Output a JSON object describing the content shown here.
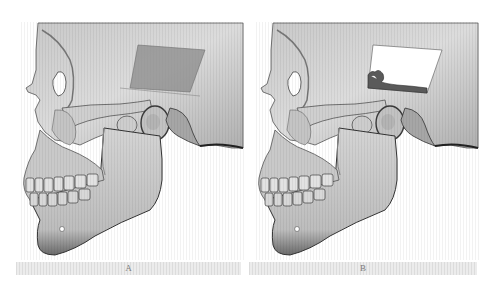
{
  "figure": {
    "panels": [
      {
        "id": "A",
        "label": "A",
        "subject": "lateral 3D skull rendering with semi-transparent rectangular plane over temporal region",
        "overlay": {
          "type": "plane",
          "color": "#8a8a8a",
          "opacity": 0.75
        }
      },
      {
        "id": "B",
        "label": "B",
        "subject": "lateral 3D skull rendering with rectangular cutaway window over temporal region exposing internal structure",
        "overlay": {
          "type": "cutaway",
          "color": "#ffffff"
        }
      }
    ]
  },
  "colors": {
    "background": "#ffffff",
    "bone_light": "#d9d9d9",
    "bone_mid": "#a8a8a8",
    "bone_dark": "#3a3a3a",
    "caption_bar": "#e6e6e6",
    "caption_text": "#7a7a7a"
  }
}
